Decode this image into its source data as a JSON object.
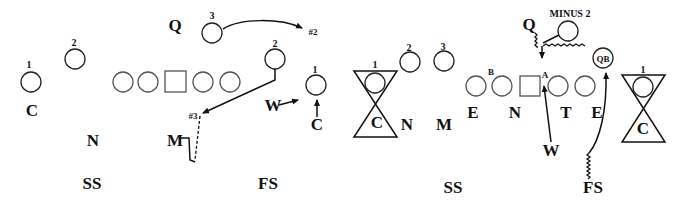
{
  "left_diagram": {
    "offense_numbers": {
      "left_1": "1",
      "left_2": "2",
      "right_3": "3",
      "right_2": "2",
      "right_1": "1"
    },
    "defense": {
      "corner_left": "C",
      "nickel": "N",
      "strong_safety": "SS",
      "q": "Q",
      "mike": "M",
      "free_safety": "FS",
      "will": "W",
      "corner_right": "C"
    },
    "route_labels": {
      "num2": "#2",
      "num3": "#3"
    }
  },
  "right_diagram": {
    "receiver_numbers": {
      "left_1": "1",
      "left_2": "2",
      "left_3": "3",
      "right_1": "1"
    },
    "defense": {
      "corner_left": "C",
      "nickel": "N",
      "mike": "M",
      "end_left": "E",
      "nose": "N",
      "tackle": "T",
      "end_right": "E",
      "q": "Q",
      "will": "W",
      "strong_safety": "SS",
      "free_safety": "FS",
      "corner_right": "C"
    },
    "gap_labels": {
      "b_gap": "B",
      "a_gap": "A"
    },
    "annotations": {
      "minus2": "MINUS 2",
      "qb": "QB"
    }
  }
}
